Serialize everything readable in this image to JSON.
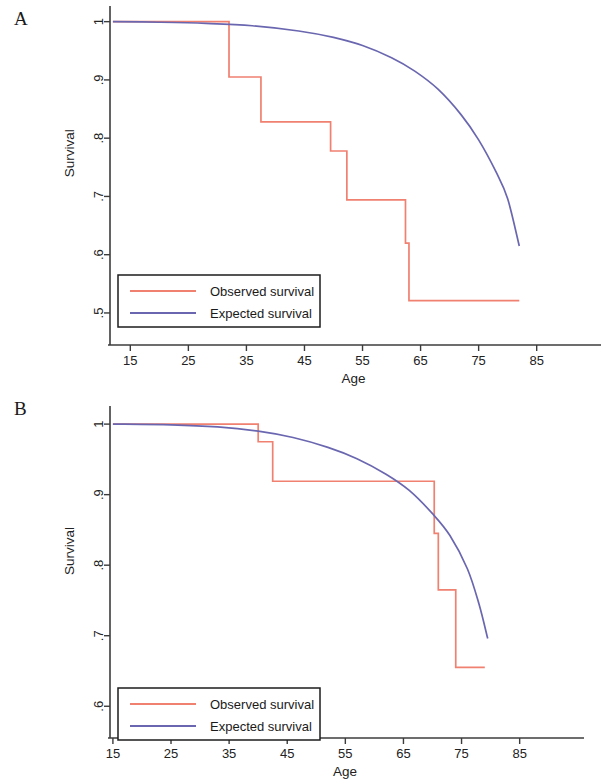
{
  "figure": {
    "panels": [
      {
        "letter": "A",
        "xlabel": "Age",
        "ylabel": "Survival",
        "xticks": [
          15,
          25,
          35,
          45,
          55,
          65,
          75,
          85
        ],
        "xtick_labels": [
          "15",
          "25",
          "35",
          "45",
          "55",
          "65",
          "75",
          "85"
        ],
        "yticks": [
          1,
          0.9,
          0.8,
          0.7,
          0.6,
          0.5
        ],
        "ytick_labels": [
          "1",
          ".9",
          ".8",
          ".7",
          ".6",
          ".5"
        ],
        "legend": [
          {
            "label": "Observed survival",
            "color": "#f08070"
          },
          {
            "label": "Expected survival",
            "color": "#6a67b0"
          }
        ]
      },
      {
        "letter": "B",
        "xlabel": "Age",
        "ylabel": "Survival",
        "xticks": [
          15,
          25,
          35,
          45,
          55,
          65,
          75,
          85
        ],
        "xtick_labels": [
          "15",
          "25",
          "35",
          "45",
          "55",
          "65",
          "75",
          "85"
        ],
        "yticks": [
          1,
          0.9,
          0.8,
          0.7,
          0.6
        ],
        "ytick_labels": [
          "1",
          ".9",
          ".8",
          ".7",
          ".6"
        ],
        "legend": [
          {
            "label": "Observed survival",
            "color": "#f08070"
          },
          {
            "label": "Expected survival",
            "color": "#6a67b0"
          }
        ]
      }
    ]
  },
  "chart_data": [
    {
      "type": "line",
      "title": "A",
      "xlabel": "Age",
      "ylabel": "Survival",
      "xlim": [
        11.5,
        88.5
      ],
      "ylim": [
        0.445,
        1.02
      ],
      "grid": false,
      "legend_position": "bottom-left",
      "series": [
        {
          "name": "Observed survival",
          "color": "#f08070",
          "style": "step",
          "x": [
            12.0,
            32.0,
            32.0,
            37.5,
            37.5,
            49.5,
            49.5,
            52.3,
            52.3,
            62.4,
            62.4,
            63.0,
            63.0,
            82.0
          ],
          "y": [
            1.0,
            1.0,
            0.905,
            0.905,
            0.828,
            0.828,
            0.778,
            0.778,
            0.694,
            0.694,
            0.62,
            0.62,
            0.521,
            0.521
          ]
        },
        {
          "name": "Expected survival",
          "color": "#6a67b0",
          "style": "smooth",
          "x": [
            12,
            20,
            28,
            36,
            44,
            50,
            55,
            60,
            64,
            68,
            72,
            75,
            78,
            80,
            82
          ],
          "y": [
            1.0,
            0.999,
            0.997,
            0.993,
            0.984,
            0.973,
            0.959,
            0.938,
            0.915,
            0.884,
            0.84,
            0.797,
            0.742,
            0.696,
            0.615
          ]
        }
      ]
    },
    {
      "type": "line",
      "title": "B",
      "xlabel": "Age",
      "ylabel": "Survival",
      "xlim": [
        14.5,
        88.5
      ],
      "ylim": [
        0.555,
        1.02
      ],
      "grid": false,
      "legend_position": "bottom-left",
      "series": [
        {
          "name": "Observed survival",
          "color": "#f08070",
          "style": "step",
          "x": [
            15.0,
            40.0,
            40.0,
            42.5,
            42.5,
            69.5,
            69.5,
            70.3,
            70.3,
            71.0,
            71.0,
            74.0,
            74.0,
            79.0
          ],
          "y": [
            1.0,
            1.0,
            0.975,
            0.975,
            0.919,
            0.919,
            0.919,
            0.919,
            0.845,
            0.845,
            0.765,
            0.765,
            0.655,
            0.655
          ]
        },
        {
          "name": "Expected survival",
          "color": "#6a67b0",
          "style": "smooth",
          "x": [
            15,
            25,
            33,
            40,
            46,
            52,
            57,
            62,
            66,
            70,
            73,
            76,
            78,
            79.5
          ],
          "y": [
            1.0,
            0.999,
            0.996,
            0.99,
            0.981,
            0.967,
            0.951,
            0.929,
            0.906,
            0.873,
            0.842,
            0.795,
            0.745,
            0.696
          ]
        }
      ]
    }
  ]
}
